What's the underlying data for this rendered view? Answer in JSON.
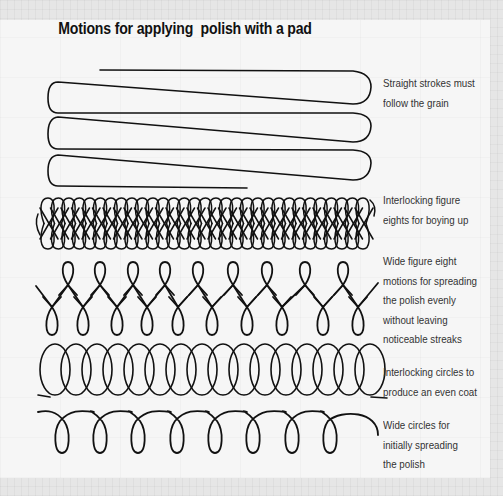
{
  "title": "Motions for applying  polish with a pad",
  "colors": {
    "ink": "#111111",
    "text": "#333333",
    "paper": "#f6f6f6",
    "border": "#e6e6e6"
  },
  "motions": [
    {
      "id": "straight-strokes",
      "type": "straight_strokes",
      "caption_lines": [
        "Straight strokes must",
        "follow the grain"
      ],
      "caption_top": 74,
      "geometry": {
        "start_x": 100,
        "left_x": 48,
        "right_x": 365,
        "rows_y": [
          82,
          115,
          152,
          188
        ],
        "end_x": 247,
        "turn_radius": 16
      }
    },
    {
      "id": "interlocking-figure-eights",
      "type": "interlocking_figure_eights",
      "caption_lines": [
        "Interlocking figure",
        "eights for boying up"
      ],
      "caption_top": 191,
      "geometry": {
        "x_start": 44,
        "x_end": 374,
        "y_top": 198,
        "y_bottom": 249,
        "spacing": 10.5
      }
    },
    {
      "id": "wide-figure-eight",
      "type": "wide_figure_eight",
      "caption_lines": [
        "Wide figure eight",
        "motions for spreading",
        "the polish evenly",
        "without leaving",
        "noticeable streaks"
      ],
      "caption_top": 252,
      "geometry": {
        "upper_loops_x": [
          68,
          100,
          133,
          165,
          198,
          233,
          267,
          305,
          343
        ],
        "lower_loops_x": [
          52,
          83,
          117,
          147,
          178,
          212,
          247,
          282,
          323,
          358
        ],
        "start": [
          36,
          286
        ],
        "end": [
          378,
          283
        ],
        "upper_top": 262,
        "lower_bottom": 335,
        "mid_y": 297
      }
    },
    {
      "id": "interlocking-circles",
      "type": "interlocking_circles",
      "caption_lines": [
        "Interlocking circles to",
        "produce an even coat"
      ],
      "caption_top": 363,
      "geometry": {
        "x_start": 40,
        "count": 16,
        "spacing": 21,
        "width": 30,
        "y_top": 343,
        "y_base": 396
      }
    },
    {
      "id": "wide-circles",
      "type": "wide_circles",
      "caption_lines": [
        "Wide circles for",
        "initially spreading",
        "the polish"
      ],
      "caption_top": 416,
      "geometry": {
        "loops_x": [
          62,
          100,
          138,
          177,
          215,
          253,
          292,
          330
        ],
        "start": [
          38,
          412
        ],
        "end_x": 378,
        "end_y": 435,
        "arc_top": 411,
        "loop_bottom": 453,
        "cross_y": 421
      }
    }
  ]
}
